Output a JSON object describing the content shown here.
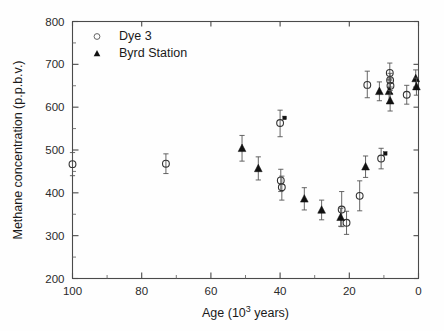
{
  "chart_data": {
    "type": "scatter",
    "title": "",
    "xlabel": "Age (10³ years)",
    "xlabel_parts": {
      "pre": "Age (10",
      "sup": "3",
      "post": " years)"
    },
    "ylabel": "Methane concentration (p.p.b.v.)",
    "xlim": [
      100,
      0
    ],
    "ylim": [
      200,
      800
    ],
    "x_reversed": true,
    "grid": false,
    "x_ticks": [
      100,
      80,
      60,
      40,
      20,
      0
    ],
    "x_ticklabels": [
      "100",
      "80",
      "60",
      "40",
      "20",
      "0"
    ],
    "x_minor_ticks": [
      90,
      70,
      50,
      30,
      10
    ],
    "y_ticks": [
      200,
      300,
      400,
      500,
      600,
      700,
      800
    ],
    "y_ticklabels": [
      "200",
      "300",
      "400",
      "500",
      "600",
      "700",
      "800"
    ],
    "y_minor_ticks": [
      250,
      350,
      450,
      550,
      650,
      750
    ],
    "legend_position": "upper-left",
    "legend": [
      {
        "label": "Dye 3",
        "marker": "open-circle"
      },
      {
        "label": "Byrd Station",
        "marker": "filled-triangle"
      }
    ],
    "series": [
      {
        "name": "Dye 3",
        "marker": "open-circle",
        "points": [
          {
            "x": 100.0,
            "y": 467,
            "yerr_low": 27,
            "yerr_high": 27
          },
          {
            "x": 73.0,
            "y": 468,
            "yerr_low": 23,
            "yerr_high": 23
          },
          {
            "x": 40.0,
            "y": 563,
            "yerr_low": 32,
            "yerr_high": 30,
            "flag": "asterisk"
          },
          {
            "x": 39.8,
            "y": 429,
            "yerr_low": 26,
            "yerr_high": 26
          },
          {
            "x": 39.5,
            "y": 413,
            "yerr_low": 30,
            "yerr_high": 26
          },
          {
            "x": 22.2,
            "y": 361,
            "yerr_low": 40,
            "yerr_high": 42
          },
          {
            "x": 20.8,
            "y": 330,
            "yerr_low": 27,
            "yerr_high": 27
          },
          {
            "x": 17.0,
            "y": 393,
            "yerr_low": 35,
            "yerr_high": 35
          },
          {
            "x": 14.8,
            "y": 652,
            "yerr_low": 30,
            "yerr_high": 32
          },
          {
            "x": 10.8,
            "y": 480,
            "yerr_low": 24,
            "yerr_high": 24,
            "flag": "asterisk"
          },
          {
            "x": 8.3,
            "y": 680,
            "yerr_low": 17,
            "yerr_high": 23
          },
          {
            "x": 8.2,
            "y": 663,
            "yerr_low": 16,
            "yerr_high": 16
          },
          {
            "x": 8.1,
            "y": 650,
            "yerr_low": 18,
            "yerr_high": 18
          },
          {
            "x": 3.4,
            "y": 629,
            "yerr_low": 22,
            "yerr_high": 22
          }
        ]
      },
      {
        "name": "Byrd Station",
        "marker": "filled-triangle",
        "points": [
          {
            "x": 51.0,
            "y": 504,
            "yerr_low": 30,
            "yerr_high": 30
          },
          {
            "x": 46.3,
            "y": 457,
            "yerr_low": 27,
            "yerr_high": 27
          },
          {
            "x": 33.0,
            "y": 386,
            "yerr_low": 26,
            "yerr_high": 26
          },
          {
            "x": 28.0,
            "y": 360,
            "yerr_low": 23,
            "yerr_high": 23
          },
          {
            "x": 22.5,
            "y": 343,
            "yerr_low": 21,
            "yerr_high": 21
          },
          {
            "x": 15.3,
            "y": 461,
            "yerr_low": 25,
            "yerr_high": 25
          },
          {
            "x": 11.3,
            "y": 637,
            "yerr_low": 22,
            "yerr_high": 22
          },
          {
            "x": 8.5,
            "y": 637,
            "yerr_low": 28,
            "yerr_high": 28
          },
          {
            "x": 8.2,
            "y": 615,
            "yerr_low": 24,
            "yerr_high": 24
          },
          {
            "x": 0.8,
            "y": 667,
            "yerr_low": 20,
            "yerr_high": 20
          },
          {
            "x": 0.6,
            "y": 648,
            "yerr_low": 20,
            "yerr_high": 20
          }
        ]
      }
    ],
    "annotations": [
      {
        "type": "asterisk-marker",
        "x": 38.7,
        "y": 575
      },
      {
        "type": "asterisk-marker",
        "x": 9.6,
        "y": 492
      }
    ]
  }
}
